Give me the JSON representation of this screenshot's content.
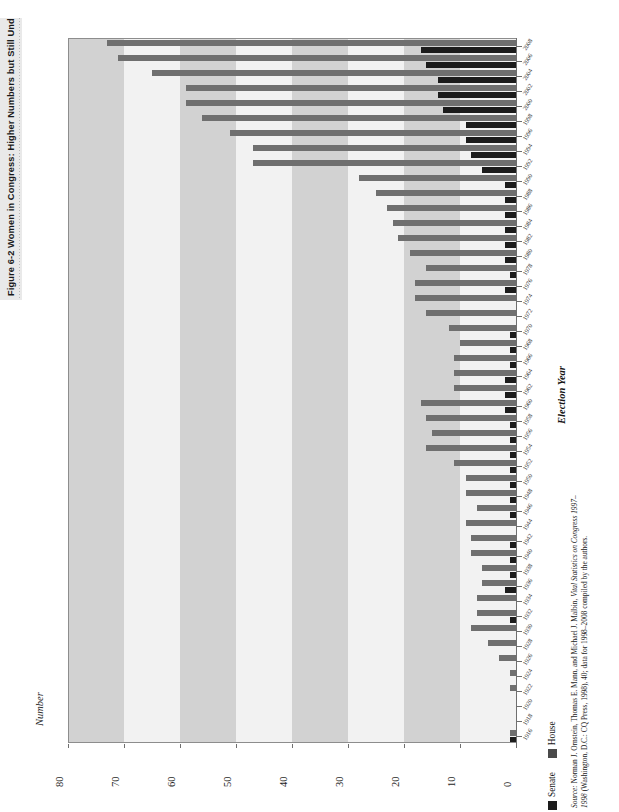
{
  "figure": {
    "title": "Figure 6-2  Women in Congress: Higher Numbers but Still Underrepresented",
    "value_axis_title": "Number",
    "category_axis_title": "Election Year",
    "source_label": "Source:",
    "source_text_a": " Norman J. Ornstein, Thomas E. Mann, and Michael J. Malbin, ",
    "source_text_italic": "Vital Statistics on Congress 1997–1998",
    "source_text_b": " (Washington, D.C.: CQ Press, 1998), 40; data for 1998–2008 compiled by the authors."
  },
  "legend": {
    "items": [
      {
        "label": "Senate",
        "color": "#1c1c1c",
        "key": "senate"
      },
      {
        "label": "House",
        "color": "#4a4a4a",
        "key": "house"
      }
    ]
  },
  "colors": {
    "band_light": "#f2f2f2",
    "band_dark": "#d2d2d2",
    "house_bar": "#6f6f6f",
    "senate_bar": "#1c1c1c",
    "axis": "#6f6f6f",
    "title_strip": "#e9e9e9"
  },
  "chart_data": {
    "type": "bar",
    "orientation": "horizontal-rotated",
    "title": "Women in Congress: Higher Numbers but Still Underrepresented",
    "xlabel": "Election Year",
    "ylabel": "Number",
    "ylim": [
      0,
      80
    ],
    "yticks": [
      80,
      70,
      60,
      50,
      40,
      30,
      20,
      10,
      0
    ],
    "grid": false,
    "bands": "alternating vertical gray bands every 10 units",
    "legend_position": "bottom-right",
    "categories": [
      "2008",
      "2006",
      "2004",
      "2002",
      "2000",
      "1998",
      "1996",
      "1994",
      "1992",
      "1990",
      "1988",
      "1986",
      "1984",
      "1982",
      "1980",
      "1978",
      "1976",
      "1974",
      "1972",
      "1970",
      "1968",
      "1966",
      "1964",
      "1962",
      "1960",
      "1958",
      "1956",
      "1954",
      "1952",
      "1950",
      "1948",
      "1946",
      "1944",
      "1942",
      "1940",
      "1938",
      "1936",
      "1934",
      "1932",
      "1930",
      "1928",
      "1926",
      "1924",
      "1922",
      "1920",
      "1918",
      "1916"
    ],
    "series": [
      {
        "name": "House",
        "color": "#6f6f6f",
        "values": [
          73,
          71,
          65,
          59,
          59,
          56,
          51,
          47,
          47,
          28,
          25,
          23,
          22,
          21,
          19,
          16,
          18,
          18,
          16,
          12,
          10,
          11,
          11,
          11,
          17,
          16,
          15,
          16,
          11,
          9,
          9,
          7,
          9,
          8,
          8,
          6,
          6,
          7,
          7,
          8,
          5,
          3,
          1,
          1,
          0,
          0,
          1
        ]
      },
      {
        "name": "Senate",
        "color": "#1c1c1c",
        "values": [
          17,
          16,
          14,
          14,
          13,
          9,
          9,
          8,
          6,
          2,
          2,
          2,
          2,
          2,
          2,
          1,
          2,
          0,
          0,
          1,
          1,
          1,
          2,
          2,
          2,
          1,
          1,
          1,
          1,
          1,
          1,
          1,
          0,
          1,
          1,
          1,
          2,
          0,
          1,
          0,
          0,
          0,
          0,
          0,
          0,
          0,
          1
        ]
      }
    ]
  }
}
